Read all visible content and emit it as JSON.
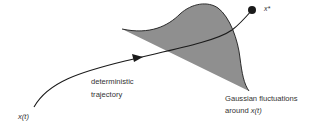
{
  "diagram": {
    "labels": {
      "start": "x(t)",
      "trajectory_line1": "deterministic",
      "trajectory_line2": "trajectory",
      "fixed_point": "x*",
      "fluctuations_line1": "Gaussian fluctuations",
      "fluctuations_line2_prefix": "around ",
      "fluctuations_line2_var": "x(t)"
    },
    "colors": {
      "gaussian_fill": "#8f8f8f",
      "stroke": "#1a1a1a",
      "text": "#333333",
      "background": "#ffffff"
    }
  }
}
